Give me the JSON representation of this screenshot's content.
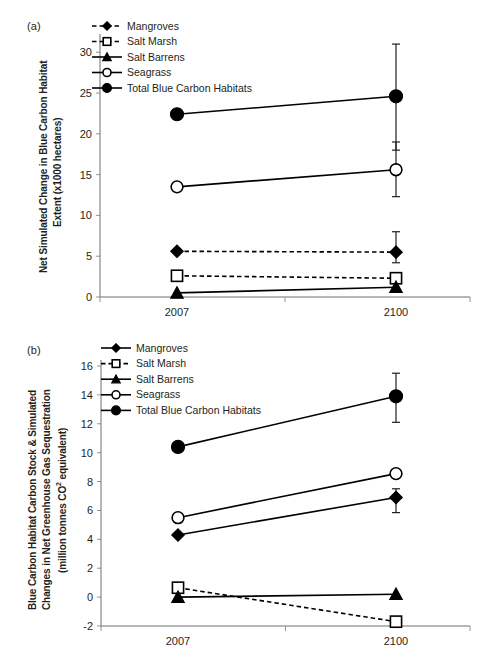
{
  "figure": {
    "background": "#ffffff",
    "ink_color": "#231f20",
    "axis_color": "#6d6e71"
  },
  "panels": [
    {
      "tag": "(a)",
      "ylabel_line1": "Net Simulated Change in Blue Carbon Habitat",
      "ylabel_line2": "Extent (x1000 hectares)"
    },
    {
      "tag": "(b)",
      "ylabel_line1": "Blue Carbon Habitat Carbon Stock & Simulated",
      "ylabel_line2": "Changes in Net Greenhouse Gas Sequestration",
      "ylabel_line3": "(million tonnes CO² equivalent)"
    }
  ],
  "legend": {
    "entries": [
      {
        "label": "Mangroves",
        "marker": "filled-diamond"
      },
      {
        "label": "Salt Marsh",
        "marker": "open-square"
      },
      {
        "label": "Salt Barrens",
        "marker": "filled-triangle"
      },
      {
        "label": "Seagrass",
        "marker": "open-circle"
      },
      {
        "label": "Total Blue Carbon Habitats",
        "marker": "filled-circle"
      }
    ]
  },
  "chart_data": [
    {
      "type": "line",
      "panel": "(a)",
      "title": "",
      "xlabel": "",
      "ylabel": "Net Simulated Change in Blue Carbon Habitat Extent (x1000 hectares)",
      "categories": [
        "2007",
        "2100"
      ],
      "x": [
        2007,
        2100
      ],
      "xtick_labels": [
        "2007",
        "2100"
      ],
      "ytick_labels": [
        "0",
        "5",
        "10",
        "15",
        "20",
        "25",
        "30"
      ],
      "yticks": [
        0,
        5,
        10,
        15,
        20,
        25,
        30
      ],
      "ylim": [
        0,
        31.5
      ],
      "grid": false,
      "legend_position": "top-left",
      "series": [
        {
          "name": "Mangroves",
          "marker": "filled-diamond",
          "linestyle": "dashed",
          "values": [
            5.6,
            5.5
          ],
          "error_low": [
            null,
            4.2
          ],
          "error_high": [
            null,
            8.0
          ]
        },
        {
          "name": "Salt Marsh",
          "marker": "open-square",
          "linestyle": "dashed",
          "values": [
            2.6,
            2.3
          ],
          "error_low": [
            null,
            null
          ],
          "error_high": [
            null,
            null
          ]
        },
        {
          "name": "Salt Barrens",
          "marker": "filled-triangle",
          "linestyle": "solid",
          "values": [
            0.5,
            1.2
          ],
          "error_low": [
            null,
            null
          ],
          "error_high": [
            null,
            null
          ]
        },
        {
          "name": "Seagrass",
          "marker": "open-circle",
          "linestyle": "solid",
          "values": [
            13.5,
            15.6
          ],
          "error_low": [
            null,
            12.3
          ],
          "error_high": [
            null,
            19.0
          ]
        },
        {
          "name": "Total Blue Carbon Habitats",
          "marker": "filled-circle",
          "linestyle": "solid",
          "values": [
            22.4,
            24.6
          ],
          "error_low": [
            null,
            18.0
          ],
          "error_high": [
            null,
            31.0
          ]
        }
      ]
    },
    {
      "type": "line",
      "panel": "(b)",
      "title": "",
      "xlabel": "",
      "ylabel": "Blue Carbon Habitat Carbon Stock & Simulated Changes in Net Greenhouse Gas Sequestration (million tonnes CO² equivalent)",
      "categories": [
        "2007",
        "2100"
      ],
      "x": [
        2007,
        2100
      ],
      "xtick_labels": [
        "2007",
        "2100"
      ],
      "ytick_labels": [
        "-2",
        "0",
        "2",
        "4",
        "6",
        "8",
        "10",
        "12",
        "14",
        "16"
      ],
      "yticks": [
        -2,
        0,
        2,
        4,
        6,
        8,
        10,
        12,
        14,
        16
      ],
      "ylim": [
        -2,
        16
      ],
      "grid": false,
      "legend_position": "top-left",
      "series": [
        {
          "name": "Mangroves",
          "marker": "filled-diamond",
          "linestyle": "solid",
          "values": [
            4.3,
            6.9
          ],
          "error_low": [
            null,
            5.85
          ],
          "error_high": [
            null,
            7.5
          ]
        },
        {
          "name": "Salt Marsh",
          "marker": "open-square",
          "linestyle": "dashed",
          "values": [
            0.65,
            -1.7
          ],
          "error_low": [
            null,
            null
          ],
          "error_high": [
            null,
            null
          ]
        },
        {
          "name": "Salt Barrens",
          "marker": "filled-triangle",
          "linestyle": "solid",
          "values": [
            0.0,
            0.2
          ],
          "error_low": [
            null,
            null
          ],
          "error_high": [
            null,
            null
          ]
        },
        {
          "name": "Seagrass",
          "marker": "open-circle",
          "linestyle": "solid",
          "values": [
            5.5,
            8.55
          ],
          "error_low": [
            null,
            null
          ],
          "error_high": [
            null,
            null
          ]
        },
        {
          "name": "Total Blue Carbon Habitats",
          "marker": "filled-circle",
          "linestyle": "solid",
          "values": [
            10.4,
            13.9
          ],
          "error_low": [
            null,
            12.1
          ],
          "error_high": [
            null,
            15.5
          ]
        }
      ]
    }
  ]
}
